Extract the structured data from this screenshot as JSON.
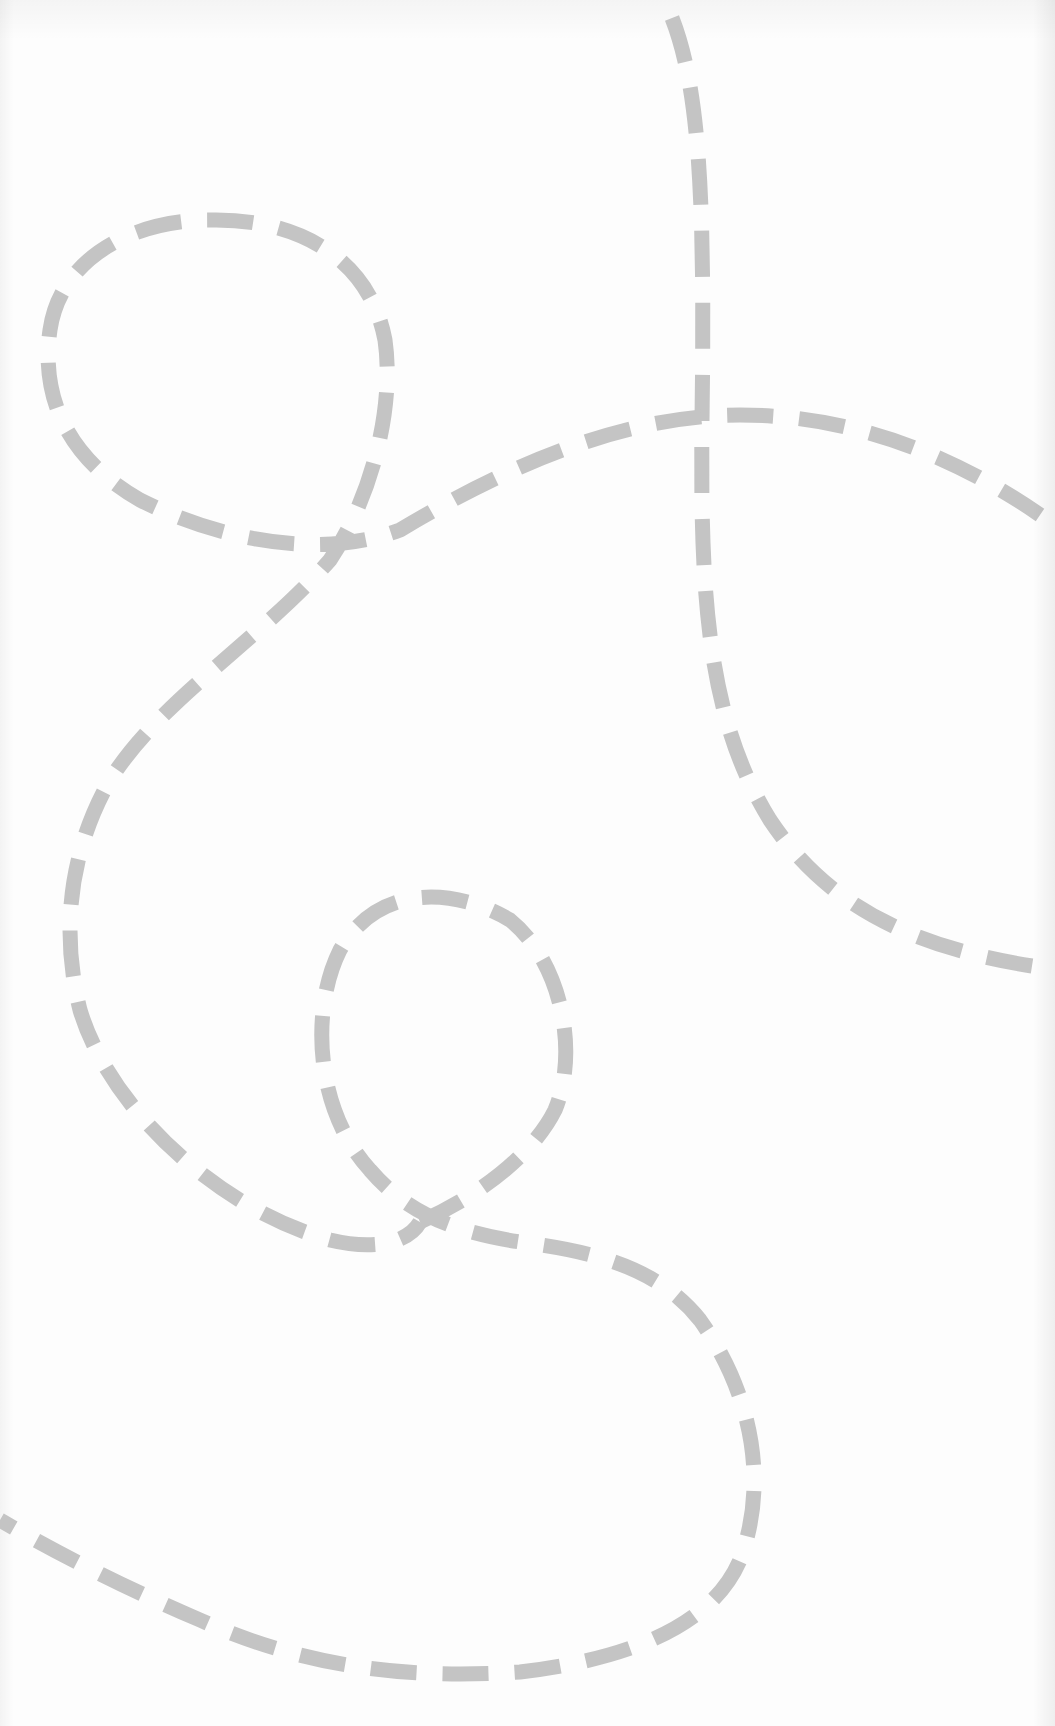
{
  "page": {
    "kind": "scanned tracing worksheet",
    "background_color": "#fdfdfd",
    "visible_text": []
  },
  "style": {
    "dash_color": "#c4c4c4",
    "stroke_width": 15,
    "dash_pattern": "46 26"
  },
  "paths": [
    {
      "name": "vertical-line-curving-right",
      "description": "Starts at the top center-right, runs down, and curves off the right edge near mid-page",
      "d": "M 672 18 C 700 90, 705 200, 702 420 C 700 600, 708 720, 770 820 C 830 910, 920 950, 1045 968"
    },
    {
      "name": "top-loop-and-sweep",
      "description": "Loop in the upper left that crosses itself and sweeps right, exiting the right edge",
      "d": "M 1040 515 C 960 460, 860 415, 740 415 C 620 415, 500 470, 400 530 C 320 560, 220 540, 140 500 C 70 460, 40 400, 50 330 C 60 260, 130 220, 210 220 C 300 218, 370 260, 385 340 C 395 410, 370 500, 330 560 C 260 640, 160 700, 110 780 C 70 850, 60 930, 80 1010 C 110 1110, 220 1210, 330 1240 C 380 1252, 410 1240, 420 1222"
    },
    {
      "name": "lower-loop-and-tail",
      "description": "Lower-middle loop that merges into a large curve, sweeping left and off the left edge",
      "d": "M 420 1222 C 470 1200, 530 1160, 555 1110 C 580 1050, 560 960, 510 920 C 460 890, 380 880, 340 950 C 310 1010, 315 1110, 370 1170 C 400 1205, 440 1230, 520 1242 C 600 1252, 660 1270, 700 1320 C 750 1390, 770 1480, 740 1560 C 710 1630, 620 1660, 520 1672 C 400 1680, 300 1665, 200 1620 C 130 1590, 60 1555, 0 1520"
    }
  ]
}
